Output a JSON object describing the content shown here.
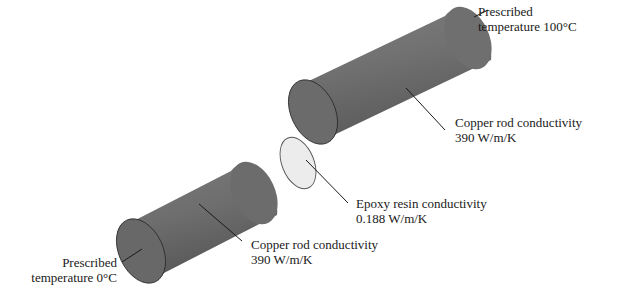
{
  "diagram": {
    "components": [
      {
        "id": "copper-rod-right",
        "material": "Copper",
        "conductivity": "390 W/m/K"
      },
      {
        "id": "epoxy-disc",
        "material": "Epoxy resin",
        "conductivity": "0.188 W/m/K"
      },
      {
        "id": "copper-rod-left",
        "material": "Copper",
        "conductivity": "390 W/m/K"
      }
    ],
    "colors": {
      "rod_body": "#6e6e6e",
      "rod_highlight": "#8a8a8a",
      "rod_end": "#6a6a6a",
      "disc_fill": "#ececec",
      "outline": "#2a2a2a"
    }
  },
  "labels": {
    "top_temp": {
      "line1": "Prescribed",
      "line2": "temperature 100°C"
    },
    "right_rod": {
      "line1": "Copper rod conductivity",
      "line2": "390 W/m/K"
    },
    "epoxy": {
      "line1": "Epoxy resin conductivity",
      "line2": "0.188 W/m/K"
    },
    "left_rod": {
      "line1": "Copper rod conductivity",
      "line2": "390 W/m/K"
    },
    "bottom_temp": {
      "line1": "Prescribed",
      "line2": "temperature 0°C"
    }
  }
}
